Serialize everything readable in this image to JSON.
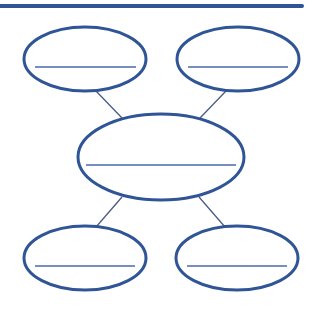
{
  "diagram": {
    "type": "bubble-map",
    "colors": {
      "header_bar": "#2f5597",
      "ellipse_stroke": "#2f5597",
      "connector": "#4a5a85",
      "blank_line": "#4a6aa8",
      "background": "#ffffff"
    },
    "header_bar": {
      "x1": 0,
      "y1": 6,
      "x2": 302,
      "y2": 6,
      "width": 4
    },
    "center_node": {
      "id": "center",
      "cx": 161,
      "cy": 157,
      "rx": 83,
      "ry": 43,
      "label": "",
      "line": {
        "x1": 86,
        "x2": 236,
        "y": 165
      }
    },
    "outer_nodes": [
      {
        "id": "top-left",
        "cx": 85,
        "cy": 59,
        "rx": 61,
        "ry": 32,
        "label": "",
        "line": {
          "x1": 35,
          "x2": 136,
          "y": 67
        }
      },
      {
        "id": "top-right",
        "cx": 238,
        "cy": 59,
        "rx": 61,
        "ry": 32,
        "label": "",
        "line": {
          "x1": 188,
          "x2": 288,
          "y": 67
        }
      },
      {
        "id": "bottom-left",
        "cx": 85,
        "cy": 258,
        "rx": 61,
        "ry": 32,
        "label": "",
        "line": {
          "x1": 35,
          "x2": 135,
          "y": 266
        }
      },
      {
        "id": "bottom-right",
        "cx": 237,
        "cy": 258,
        "rx": 61,
        "ry": 32,
        "label": "",
        "line": {
          "x1": 187,
          "x2": 287,
          "y": 266
        }
      }
    ],
    "connectors": [
      {
        "from": "top-left",
        "to": "center",
        "x1": 96,
        "y1": 91,
        "x2": 122,
        "y2": 118
      },
      {
        "from": "top-right",
        "to": "center",
        "x1": 226,
        "y1": 91,
        "x2": 200,
        "y2": 118
      },
      {
        "from": "center",
        "to": "bottom-left",
        "x1": 122,
        "y1": 197,
        "x2": 96,
        "y2": 227
      },
      {
        "from": "center",
        "to": "bottom-right",
        "x1": 199,
        "y1": 197,
        "x2": 225,
        "y2": 227
      }
    ]
  }
}
